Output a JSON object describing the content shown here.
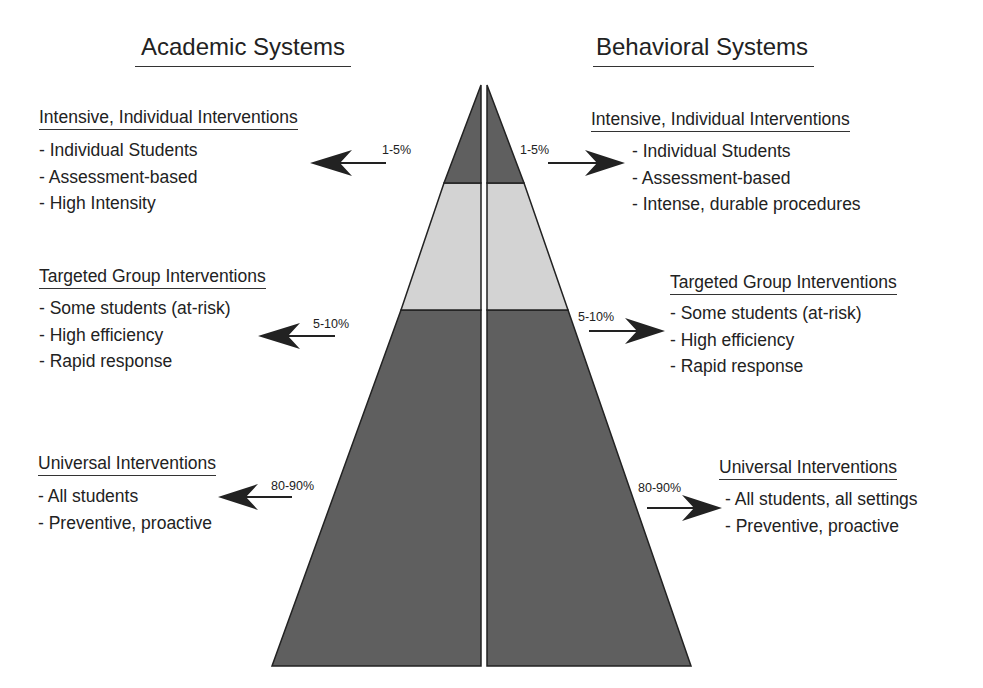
{
  "colors": {
    "dark_tier": "#5f5f5f",
    "light_tier": "#d3d3d3",
    "outline": "#222222",
    "text": "#222222"
  },
  "academic": {
    "title": "Academic Systems",
    "tiers": [
      {
        "heading": "Intensive, Individual Interventions",
        "items": [
          "- Individual Students",
          "- Assessment-based",
          "- High Intensity"
        ],
        "percent": "1-5%"
      },
      {
        "heading": "Targeted Group Interventions",
        "items": [
          "- Some students (at-risk)",
          "- High efficiency",
          "- Rapid response"
        ],
        "percent": "5-10%"
      },
      {
        "heading": "Universal Interventions",
        "items": [
          "- All students",
          "- Preventive, proactive"
        ],
        "percent": "80-90%"
      }
    ]
  },
  "behavioral": {
    "title": "Behavioral Systems",
    "tiers": [
      {
        "heading": "Intensive, Individual Interventions",
        "items": [
          "- Individual Students",
          "- Assessment-based",
          "- Intense, durable procedures"
        ],
        "percent": "1-5%"
      },
      {
        "heading": "Targeted Group Interventions",
        "items": [
          "- Some students (at-risk)",
          "- High efficiency",
          "- Rapid response"
        ],
        "percent": "5-10%"
      },
      {
        "heading": "Universal Interventions",
        "items": [
          "- All students, all settings",
          "- Preventive, proactive"
        ],
        "percent": "80-90%"
      }
    ]
  }
}
